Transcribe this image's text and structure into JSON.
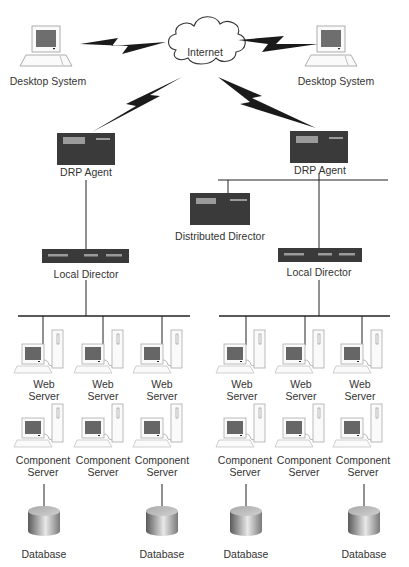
{
  "diagram": {
    "cloud": {
      "label": "Internet"
    },
    "desktops": [
      {
        "label": "Desktop System"
      },
      {
        "label": "Desktop System"
      }
    ],
    "drp_agents": [
      {
        "label": "DRP Agent"
      },
      {
        "label": "DRP Agent"
      }
    ],
    "distributed_director": {
      "label": "Distributed Director"
    },
    "local_directors": [
      {
        "label": "Local Director"
      },
      {
        "label": "Local Director"
      }
    ],
    "web_servers": [
      {
        "line1": "Web",
        "line2": "Server"
      },
      {
        "line1": "Web",
        "line2": "Server"
      },
      {
        "line1": "Web",
        "line2": "Server"
      },
      {
        "line1": "Web",
        "line2": "Server"
      },
      {
        "line1": "Web",
        "line2": "Server"
      },
      {
        "line1": "Web",
        "line2": "Server"
      }
    ],
    "component_servers": [
      {
        "line1": "Component",
        "line2": "Server"
      },
      {
        "line1": "Component",
        "line2": "Server"
      },
      {
        "line1": "Component",
        "line2": "Server"
      },
      {
        "line1": "Component",
        "line2": "Server"
      },
      {
        "line1": "Component",
        "line2": "Server"
      },
      {
        "line1": "Component",
        "line2": "Server"
      }
    ],
    "databases": [
      {
        "label": "Database"
      },
      {
        "label": "Database"
      },
      {
        "label": "Database"
      },
      {
        "label": "Database"
      }
    ],
    "colors": {
      "device_dark": "#3a3a3a",
      "device_light": "#9a9a9a",
      "line": "#222222",
      "screen": "#6e6e6e"
    }
  }
}
